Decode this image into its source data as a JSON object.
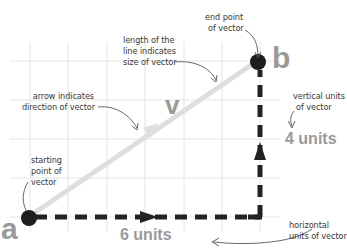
{
  "diagram": {
    "type": "vector-explanation",
    "grid": {
      "columns_x": [
        30,
        68,
        107,
        145,
        184,
        222,
        260
      ],
      "rows_y": [
        61,
        100,
        139,
        178,
        217
      ],
      "color": "#e2e2e2"
    },
    "points": {
      "a": {
        "label": "a",
        "x": 27,
        "y": 218
      },
      "b": {
        "label": "b",
        "x": 257,
        "y": 61
      }
    },
    "vector_label": "v",
    "horizontal_component": {
      "label": "6 units",
      "value": 6
    },
    "vertical_component": {
      "label": "4 units",
      "value": 4
    },
    "annotations": {
      "length": [
        "length of the",
        "line indicates",
        "size of vector"
      ],
      "end_point": [
        "end point",
        "of vector"
      ],
      "arrow": [
        "arrow indicates",
        "direction of vector"
      ],
      "vertical": [
        "vertical units",
        "of vector"
      ],
      "starting": [
        "starting",
        "point of",
        "vector"
      ],
      "horizontal": [
        "horizontal",
        "units of vector"
      ]
    },
    "colors": {
      "vector_line": "#dcdcdc",
      "point_dot": "#1e1e1e",
      "dashed_component": "#222222",
      "big_label": "#9a9a9a",
      "annotation_text": "#3a3a3a",
      "leader_line": "#555555"
    }
  }
}
